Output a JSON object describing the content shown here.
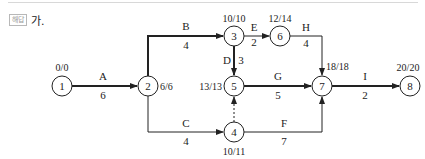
{
  "header": {
    "badge": "해답",
    "label": "가."
  },
  "network": {
    "nodes": [
      {
        "id": "1",
        "label": "1",
        "times": "0/0"
      },
      {
        "id": "2",
        "label": "2",
        "times": "6/6"
      },
      {
        "id": "3",
        "label": "3",
        "times": "10/10"
      },
      {
        "id": "4",
        "label": "4",
        "times": "10/11"
      },
      {
        "id": "5",
        "label": "5",
        "times": "13/13"
      },
      {
        "id": "6",
        "label": "6",
        "times": "12/14"
      },
      {
        "id": "7",
        "label": "7",
        "times": "18/18"
      },
      {
        "id": "8",
        "label": "8",
        "times": "20/20"
      }
    ],
    "activities": [
      {
        "name": "A",
        "duration": "6",
        "from": "1",
        "to": "2",
        "critical": true
      },
      {
        "name": "B",
        "duration": "4",
        "from": "2",
        "to": "3",
        "critical": true
      },
      {
        "name": "C",
        "duration": "4",
        "from": "2",
        "to": "4",
        "critical": false
      },
      {
        "name": "D",
        "duration": "3",
        "from": "3",
        "to": "5",
        "critical": true
      },
      {
        "name": "E",
        "duration": "2",
        "from": "3",
        "to": "6",
        "critical": false
      },
      {
        "name": "F",
        "duration": "7",
        "from": "4",
        "to": "7",
        "critical": false
      },
      {
        "name": "G",
        "duration": "5",
        "from": "5",
        "to": "7",
        "critical": true
      },
      {
        "name": "H",
        "duration": "4",
        "from": "6",
        "to": "7",
        "critical": false
      },
      {
        "name": "I",
        "duration": "2",
        "from": "7",
        "to": "8",
        "critical": true
      },
      {
        "name": "dummy",
        "duration": "",
        "from": "4",
        "to": "5",
        "critical": false
      }
    ]
  }
}
